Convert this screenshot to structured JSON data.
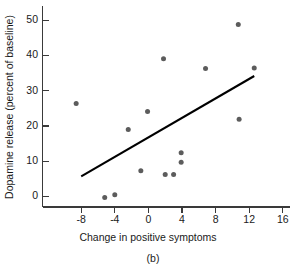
{
  "chart_data": {
    "type": "scatter",
    "title": "",
    "caption": "(b)",
    "xlabel": "Change in positive symptoms",
    "ylabel": "Dopamine release (percent of baseline)",
    "xlim": [
      -10,
      16
    ],
    "ylim": [
      -5,
      53
    ],
    "grid": false,
    "legend": "none",
    "xticks": [
      -8,
      -4,
      0,
      4,
      8,
      12,
      16
    ],
    "xtick_labels": [
      "-8",
      "-4",
      "0",
      "4",
      "8",
      "12",
      "16"
    ],
    "yticks": [
      0,
      10,
      20,
      30,
      40,
      50
    ],
    "ytick_labels": [
      "0",
      "10",
      "20",
      "30",
      "40",
      "50"
    ],
    "points": [
      {
        "x": -8.6,
        "y": 26.4
      },
      {
        "x": -5.2,
        "y": -0.3
      },
      {
        "x": -4.0,
        "y": 0.5
      },
      {
        "x": -2.4,
        "y": 19.0
      },
      {
        "x": -0.9,
        "y": 7.3
      },
      {
        "x": -0.1,
        "y": 24.1
      },
      {
        "x": 1.8,
        "y": 39.1
      },
      {
        "x": 2.0,
        "y": 6.2
      },
      {
        "x": 3.0,
        "y": 6.2
      },
      {
        "x": 3.9,
        "y": 12.4
      },
      {
        "x": 3.9,
        "y": 9.7
      },
      {
        "x": 6.8,
        "y": 36.3
      },
      {
        "x": 10.7,
        "y": 48.8
      },
      {
        "x": 10.8,
        "y": 21.9
      },
      {
        "x": 12.6,
        "y": 36.5
      }
    ],
    "trend_line": {
      "x_start": -8.0,
      "y_start": 5.7,
      "x_end": 12.6,
      "y_end": 34.2,
      "label": "regression-line"
    },
    "marker": {
      "shape": "circle",
      "radius": 2.5,
      "color": "#5c5c5c"
    },
    "line_color": "#000000",
    "axis_color": "#3a3a3a"
  }
}
